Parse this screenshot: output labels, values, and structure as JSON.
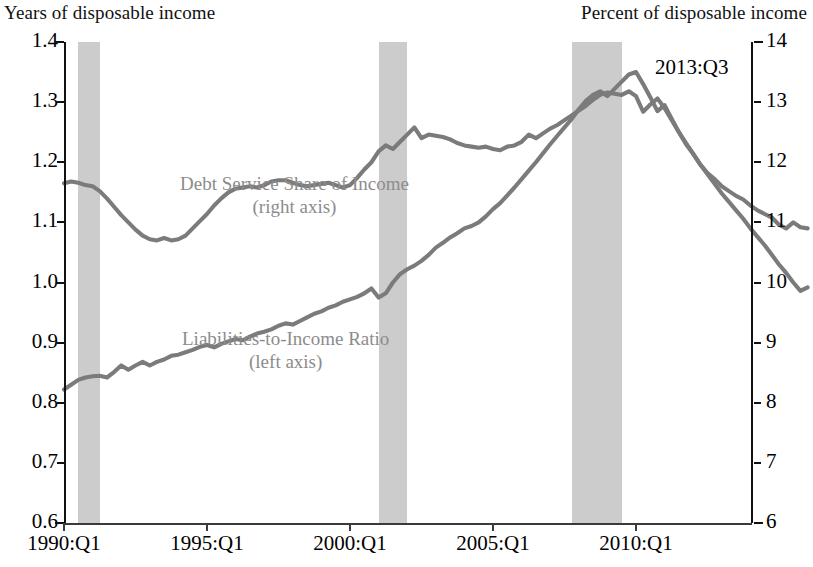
{
  "header": {
    "left_axis_title": "Years of disposable income",
    "right_axis_title": "Percent of disposable income"
  },
  "annotation": "2013:Q3",
  "series_labels": {
    "dsr_name": "Debt Service Share of Income",
    "dsr_axis": "(right axis)",
    "lti_name": "Liabilities-to-Income Ratio",
    "lti_axis": "(left axis)"
  },
  "axes": {
    "y_left_ticks": [
      "1.4",
      "1.3",
      "1.2",
      "1.1",
      "1.0",
      "0.9",
      "0.8",
      "0.7",
      "0.6"
    ],
    "y_right_ticks": [
      "14",
      "13",
      "12",
      "11",
      "10",
      "9",
      "8",
      "7",
      "6"
    ],
    "x_ticks": [
      "1990:Q1",
      "1995:Q1",
      "2000:Q1",
      "2005:Q1",
      "2010:Q1"
    ]
  },
  "colors": {
    "line": "#7b7b7b",
    "recession_band": "#c9c9c9",
    "label_gray": "#8c8c8c",
    "axis": "#111111"
  },
  "chart_data": {
    "type": "line",
    "title": "",
    "xlabel": "",
    "ylabel": "Years of disposable income",
    "y2label": "Percent of disposable income",
    "xlim": [
      "1990:Q1",
      "2013:Q3"
    ],
    "ylim": [
      0.6,
      1.4
    ],
    "y2lim": [
      6,
      14
    ],
    "grid": false,
    "legend": "inline-annotations",
    "x_start_year": 1990.0,
    "x_end_year": 2013.5,
    "x_step_years": 0.25,
    "recession_bands": [
      {
        "start": "1990:Q3",
        "end": "1991:Q1",
        "start_year": 1990.5,
        "end_year": 1991.25
      },
      {
        "start": "2001:Q1",
        "end": "2001:Q4",
        "start_year": 2001.0,
        "end_year": 2002.0
      },
      {
        "start": "2007:Q4",
        "end": "2009:Q2",
        "start_year": 2007.75,
        "end_year": 2009.5
      }
    ],
    "series": [
      {
        "name": "Liabilities-to-Income Ratio",
        "axis": "left",
        "units": "years of disposable income",
        "values": [
          0.822,
          0.83,
          0.838,
          0.842,
          0.844,
          0.845,
          0.842,
          0.851,
          0.862,
          0.855,
          0.862,
          0.868,
          0.862,
          0.868,
          0.872,
          0.878,
          0.88,
          0.884,
          0.888,
          0.893,
          0.896,
          0.892,
          0.898,
          0.902,
          0.906,
          0.904,
          0.91,
          0.915,
          0.918,
          0.922,
          0.928,
          0.932,
          0.93,
          0.936,
          0.942,
          0.948,
          0.952,
          0.958,
          0.962,
          0.968,
          0.972,
          0.976,
          0.982,
          0.99,
          0.975,
          0.982,
          1.0,
          1.014,
          1.022,
          1.028,
          1.036,
          1.046,
          1.058,
          1.066,
          1.075,
          1.082,
          1.09,
          1.094,
          1.1,
          1.11,
          1.122,
          1.132,
          1.145,
          1.158,
          1.172,
          1.186,
          1.2,
          1.215,
          1.23,
          1.244,
          1.258,
          1.272,
          1.288,
          1.302,
          1.312,
          1.318,
          1.31,
          1.322,
          1.334,
          1.346,
          1.35,
          1.33,
          1.308,
          1.285,
          1.295,
          1.272,
          1.25,
          1.232,
          1.214,
          1.196,
          1.182,
          1.172,
          1.16,
          1.152,
          1.144,
          1.138,
          1.128,
          1.12,
          1.114,
          1.108,
          1.096,
          1.09,
          1.1,
          1.092,
          1.09
        ]
      },
      {
        "name": "Debt Service Share of Income",
        "axis": "right",
        "units": "percent of disposable income",
        "values": [
          11.65,
          11.68,
          11.66,
          11.62,
          11.6,
          11.52,
          11.4,
          11.26,
          11.12,
          11.0,
          10.88,
          10.78,
          10.72,
          10.7,
          10.74,
          10.7,
          10.72,
          10.78,
          10.9,
          11.02,
          11.14,
          11.28,
          11.4,
          11.5,
          11.56,
          11.58,
          11.6,
          11.58,
          11.62,
          11.68,
          11.7,
          11.7,
          11.66,
          11.62,
          11.6,
          11.62,
          11.64,
          11.66,
          11.62,
          11.58,
          11.62,
          11.74,
          11.88,
          12.0,
          12.18,
          12.28,
          12.22,
          12.34,
          12.46,
          12.58,
          12.4,
          12.46,
          12.44,
          12.42,
          12.38,
          12.32,
          12.28,
          12.26,
          12.24,
          12.26,
          12.22,
          12.2,
          12.26,
          12.28,
          12.34,
          12.46,
          12.4,
          12.48,
          12.56,
          12.62,
          12.7,
          12.78,
          12.86,
          12.94,
          13.04,
          13.12,
          13.16,
          13.14,
          13.12,
          13.18,
          13.1,
          12.84,
          12.96,
          13.06,
          12.9,
          12.7,
          12.5,
          12.3,
          12.14,
          11.96,
          11.8,
          11.64,
          11.48,
          11.34,
          11.2,
          11.06,
          10.9,
          10.76,
          10.62,
          10.46,
          10.3,
          10.16,
          10.0,
          9.86,
          9.92
        ]
      }
    ]
  }
}
